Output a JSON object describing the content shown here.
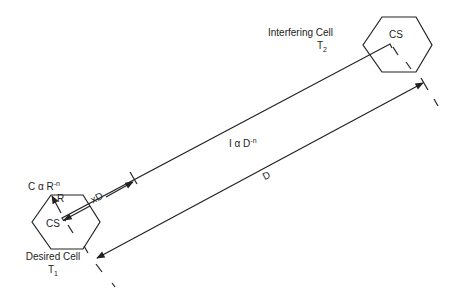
{
  "desired_cell": {
    "title": "Desired Cell",
    "tx_label": "T",
    "tx_sub": "1",
    "cs_label": "CS",
    "radius_label": "R",
    "carrier_formula_base": "C α R",
    "carrier_formula_exp": "-n"
  },
  "interfering_cell": {
    "title": "Interfering Cell",
    "tx_label": "T",
    "tx_sub": "2",
    "cs_label": "CS"
  },
  "interference_formula": {
    "base": "I α D",
    "exp": "-n"
  },
  "distance_label": "D",
  "partial_distance_label": "xD",
  "colors": {
    "line": "#222222",
    "background": "#ffffff"
  }
}
